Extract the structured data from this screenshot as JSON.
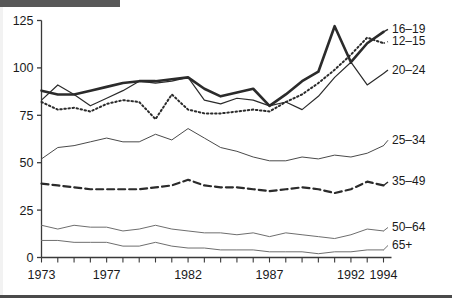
{
  "chart_data": {
    "type": "line",
    "title": "",
    "xlabel": "",
    "ylabel": "",
    "xlim": [
      1973,
      1994
    ],
    "ylim": [
      0,
      125
    ],
    "yticks": [
      0,
      25,
      50,
      75,
      100,
      125
    ],
    "ytick_labels": [
      "0",
      "25",
      "50",
      "75",
      "100",
      "125"
    ],
    "xticks": [
      1973,
      1974,
      1975,
      1976,
      1977,
      1978,
      1979,
      1980,
      1981,
      1982,
      1983,
      1984,
      1985,
      1986,
      1987,
      1988,
      1989,
      1990,
      1991,
      1992,
      1993,
      1994
    ],
    "xtick_labels_shown": [
      "1973",
      "1977",
      "1982",
      "1987",
      "1992",
      "1994"
    ],
    "grid": false,
    "legend_position": "right-inline",
    "x": [
      1973,
      1974,
      1975,
      1976,
      1977,
      1978,
      1979,
      1980,
      1981,
      1982,
      1983,
      1984,
      1985,
      1986,
      1987,
      1988,
      1989,
      1990,
      1991,
      1992,
      1993,
      1994
    ],
    "series": [
      {
        "name": "16-19",
        "label": "16–19",
        "style": "thick-solid",
        "color": "#2b2b2b",
        "width": 2.6,
        "dash": "none",
        "label_y": 118.5,
        "values": [
          88,
          86,
          86,
          88,
          90,
          92,
          93,
          93,
          94,
          95,
          89,
          85,
          87,
          89,
          80,
          86,
          93,
          98,
          122,
          103,
          113,
          119
        ]
      },
      {
        "name": "12-15",
        "label": "12–15",
        "style": "dotted",
        "color": "#2b2b2b",
        "width": 2.0,
        "dash": "1.5,2.6",
        "label_y": 112.0,
        "values": [
          82,
          78,
          79,
          77,
          81,
          83,
          82,
          73,
          86,
          78,
          76,
          76,
          77,
          78,
          77,
          82,
          86,
          92,
          99,
          107,
          116,
          113
        ]
      },
      {
        "name": "20-24",
        "label": "20–24",
        "style": "thin-solid",
        "color": "#2b2b2b",
        "width": 1.2,
        "dash": "none",
        "label_y": 97.0,
        "values": [
          83,
          91,
          86,
          80,
          84,
          88,
          93,
          92,
          93,
          95,
          83,
          81,
          84,
          83,
          80,
          82,
          78,
          85,
          95,
          103,
          91,
          97
        ]
      },
      {
        "name": "25-34",
        "label": "25–34",
        "style": "thin-solid",
        "color": "#4a4a4a",
        "width": 1.0,
        "dash": "none",
        "label_y": 60.0,
        "values": [
          52,
          58,
          59,
          61,
          63,
          61,
          61,
          65,
          62,
          68,
          63,
          58,
          56,
          53,
          51,
          51,
          53,
          52,
          54,
          53,
          55,
          59
        ]
      },
      {
        "name": "35-49",
        "label": "35–49",
        "style": "dashed",
        "color": "#2b2b2b",
        "width": 2.2,
        "dash": "7,4",
        "label_y": 38.0,
        "values": [
          39,
          38,
          37,
          36,
          36,
          36,
          36,
          37,
          38,
          41,
          38,
          37,
          37,
          36,
          35,
          36,
          37,
          36,
          34,
          36,
          40,
          38
        ]
      },
      {
        "name": "50-64",
        "label": "50–64",
        "style": "thin-solid",
        "color": "#6e6e6e",
        "width": 1.0,
        "dash": "none",
        "label_y": 14.0,
        "values": [
          17,
          15,
          17,
          16,
          16,
          14,
          15,
          17,
          15,
          14,
          13,
          13,
          12,
          13,
          11,
          13,
          12,
          11,
          10,
          12,
          15,
          14
        ]
      },
      {
        "name": "65+",
        "label": "65+",
        "style": "thin-solid",
        "color": "#6e6e6e",
        "width": 1.0,
        "dash": "none",
        "label_y": 4.5,
        "values": [
          9,
          9,
          8,
          8,
          8,
          6,
          6,
          8,
          6,
          5,
          5,
          4,
          4,
          4,
          3,
          3,
          3,
          2,
          3,
          3,
          4,
          4
        ]
      }
    ]
  },
  "axes": {
    "y_tick_labels": [
      "125",
      "100",
      "75",
      "50",
      "25",
      "0"
    ],
    "x_tick_labels": [
      {
        "year": 1973,
        "label": "1973"
      },
      {
        "year": 1977,
        "label": "1977"
      },
      {
        "year": 1982,
        "label": "1982"
      },
      {
        "year": 1987,
        "label": "1987"
      },
      {
        "year": 1992,
        "label": "1992"
      },
      {
        "year": 1994,
        "label": "1994"
      }
    ]
  }
}
